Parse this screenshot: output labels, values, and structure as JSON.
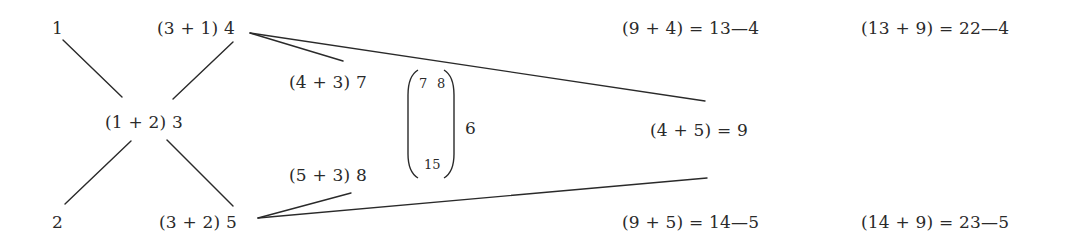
{
  "diagram": {
    "nodes": {
      "n1": "1",
      "n2": "2",
      "n3": "(1 + 2) 3",
      "n4": "(3 + 1) 4",
      "n5": "(3 + 2) 5",
      "n7": "(4 + 3) 7",
      "n8": "(5 + 3) 8",
      "n9": "(4 + 5) = 9",
      "eq_13": "(9 + 4) = 13—4",
      "eq_14": "(9 + 5) = 14—5",
      "eq_22": "(13 + 9) = 22—4",
      "eq_23": "(14 + 9) = 23—5"
    },
    "bracket": {
      "top_left": "7",
      "top_right": "8",
      "bottom": "15",
      "label": "6"
    },
    "edges": [
      {
        "from": "1",
        "to": "(1 + 2) 3"
      },
      {
        "from": "2",
        "to": "(1 + 2) 3"
      },
      {
        "from": "(1 + 2) 3",
        "to": "(3 + 1) 4"
      },
      {
        "from": "(1 + 2) 3",
        "to": "(3 + 2) 5"
      },
      {
        "from": "(3 + 1) 4",
        "to": "(4 + 3) 7"
      },
      {
        "from": "(3 + 1) 4",
        "to": "(4 + 5) = 9"
      },
      {
        "from": "(3 + 2) 5",
        "to": "(5 + 3) 8"
      },
      {
        "from": "(3 + 2) 5",
        "to": "(4 + 5) = 9"
      }
    ],
    "line_color": "#2a2a2a",
    "text_color": "#2a2a2a",
    "background": "#ffffff"
  }
}
